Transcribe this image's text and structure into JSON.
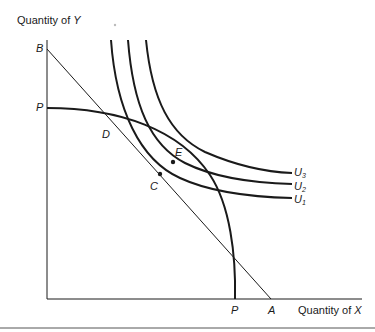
{
  "axes": {
    "y_label_prefix": "Quantity of",
    "y_label_var": "Y",
    "x_label_prefix": "Quantity of",
    "x_label_var": "X"
  },
  "points": {
    "B": "B",
    "P_y": "P",
    "D": "D",
    "E": "E",
    "C": "C",
    "P_x": "P",
    "A": "A"
  },
  "curves": {
    "u3": {
      "base": "U",
      "sub": "3"
    },
    "u2": {
      "base": "U",
      "sub": "2"
    },
    "u1": {
      "base": "U",
      "sub": "1"
    }
  },
  "colors": {
    "line": "#1a1a1a",
    "background": "#ffffff"
  }
}
